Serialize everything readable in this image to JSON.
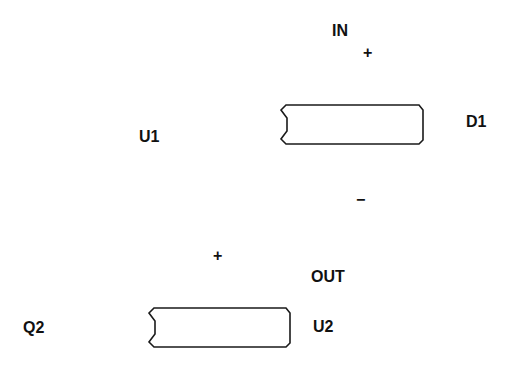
{
  "diagram": {
    "labels": {
      "in": "IN",
      "out": "OUT",
      "u1": "U1",
      "u2": "U2",
      "d1": "D1",
      "q2": "Q2"
    },
    "signs": {
      "top_plus": "+",
      "top_minus": "−",
      "bottom_plus": "+"
    },
    "components": [
      {
        "name": "component-box-1",
        "shape": "notched-rectangle"
      },
      {
        "name": "component-box-2",
        "shape": "notched-rectangle"
      }
    ],
    "colors": {
      "stroke": "#1a1a1a",
      "text": "#111111",
      "background": "#ffffff"
    }
  }
}
